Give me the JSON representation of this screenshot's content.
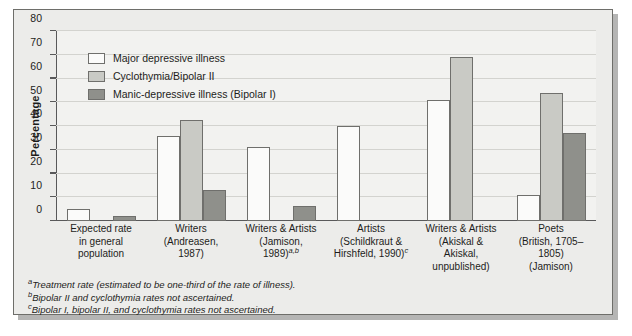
{
  "chart_data": {
    "type": "bar",
    "title": "",
    "xlabel": "",
    "ylabel": "Percentage",
    "ylim": [
      0,
      80
    ],
    "yticks": [
      0,
      10,
      20,
      30,
      40,
      50,
      60,
      70,
      80
    ],
    "grid": true,
    "legend_position": "top-left",
    "categories": [
      "Expected rate in general population",
      "Writers (Andreasen, 1987)",
      "Writers & Artists (Jamison, 1989)",
      "Artists (Schildkraut & Hirshfeld, 1990)",
      "Writers & Artists (Akiskal & Akiskal, unpublished)",
      "Poets (British, 1705–1805) (Jamison)"
    ],
    "series": [
      {
        "name": "Major depressive illness",
        "color": "#fbfbfa",
        "values": [
          5,
          36,
          31,
          40,
          51,
          11
        ]
      },
      {
        "name": "Cyclothymia/Bipolar II",
        "color": "#c9cac5",
        "values": [
          null,
          42.5,
          null,
          null,
          69,
          54
        ]
      },
      {
        "name": "Manic-depressive illness (Bipolar I)",
        "color": "#8f908b",
        "values": [
          2,
          13,
          6.5,
          null,
          null,
          37
        ]
      }
    ]
  },
  "axis": {
    "y_title": "Percentage",
    "y_ticks": [
      "0",
      "10",
      "20",
      "30",
      "40",
      "50",
      "60",
      "70",
      "80"
    ]
  },
  "legend": {
    "items": [
      {
        "label": "Major depressive illness"
      },
      {
        "label": "Cyclothymia/Bipolar II"
      },
      {
        "label": "Manic-depressive illness (Bipolar I)"
      }
    ]
  },
  "x_labels": [
    {
      "lines": [
        "Expected rate",
        "in general",
        "population"
      ],
      "marker": ""
    },
    {
      "lines": [
        "Writers",
        "(Andreasen,",
        "1987)"
      ],
      "marker": ""
    },
    {
      "lines": [
        "Writers & Artists",
        "(Jamison,",
        "1989)"
      ],
      "marker": "a,b"
    },
    {
      "lines": [
        "Artists",
        "(Schildkraut &",
        "Hirshfeld, 1990)"
      ],
      "marker": "c"
    },
    {
      "lines": [
        "Writers & Artists",
        "(Akiskal &",
        "Akiskal,",
        "unpublished)"
      ],
      "marker": ""
    },
    {
      "lines": [
        "Poets",
        "(British, 1705–1805)",
        "(Jamison)"
      ],
      "marker": ""
    }
  ],
  "footnotes": [
    {
      "marker": "a",
      "text": "Treatment rate (estimated to be one-third of the rate of illness)."
    },
    {
      "marker": "b",
      "text": "Bipolar II and cyclothymia rates not ascertained."
    },
    {
      "marker": "c",
      "text": "Bipolar I, bipolar II, and cyclothymia rates not ascertained."
    }
  ]
}
